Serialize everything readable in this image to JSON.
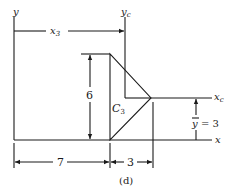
{
  "figure": {
    "caption": "(d)",
    "axes": {
      "y_label": "y",
      "x_label": "x",
      "yc_label": "y",
      "yc_sub": "c",
      "xc_label": "x",
      "xc_sub": "c"
    },
    "shape": {
      "type": "triangle",
      "label": "C",
      "label_sub": "3",
      "height": "6",
      "base": "3"
    },
    "dimensions": {
      "x3_label": "x",
      "x3_sub": "3",
      "height_label": "6",
      "offset_label": "7",
      "width_label": "3",
      "ybar_label": "y",
      "ybar_value": "= 3"
    }
  },
  "colors": {
    "line": "#1a1a1a",
    "background": "#ffffff"
  }
}
